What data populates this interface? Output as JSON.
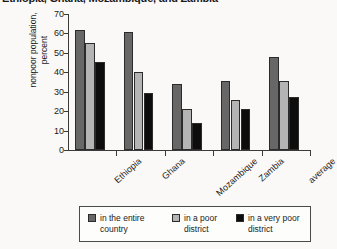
{
  "title": {
    "text": "Ethiopia, Ghana, Mozambique, and Zambia",
    "clipped": true
  },
  "chart_data": {
    "type": "bar",
    "title": "Ethiopia, Ghana, Mozambique, and Zambia",
    "xlabel": "",
    "ylabel": "nonpoor population, percent",
    "categories": [
      "Ethiopia",
      "Ghana",
      "Mozambique",
      "Zambia",
      "average"
    ],
    "series": [
      {
        "name": "in the entire country",
        "values": [
          62,
          60.5,
          34,
          35.5,
          48
        ],
        "color": "#676767"
      },
      {
        "name": "in a poor district",
        "values": [
          55,
          40,
          21,
          25.5,
          35.5
        ],
        "color": "#b4b4b4"
      },
      {
        "name": "in a very poor district",
        "values": [
          45.5,
          29.5,
          14,
          21,
          27.5
        ],
        "color": "#0d0d0d"
      }
    ],
    "ylim": [
      0,
      70
    ],
    "yticks": [
      0,
      10,
      20,
      30,
      40,
      50,
      60,
      70
    ],
    "ytick_labels": [
      "0",
      "10",
      "20",
      "30",
      "40",
      "50",
      "60",
      "70"
    ],
    "grid": false,
    "legend_position": "bottom"
  },
  "legend": {
    "entries": [
      {
        "label": "in the entire\ncountry",
        "color": "#676767"
      },
      {
        "label": "in a poor\ndistrict",
        "color": "#b4b4b4"
      },
      {
        "label": "in a very poor\ndistrict",
        "color": "#0d0d0d"
      }
    ]
  }
}
